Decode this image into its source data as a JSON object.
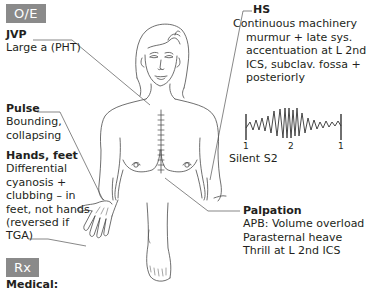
{
  "sections": {
    "oe_badge": "O/E",
    "rx_badge": "Rx"
  },
  "annotations": {
    "jvp": {
      "title": "JVP",
      "lines": [
        "Large a (PHT)"
      ]
    },
    "pulse": {
      "title": "Pulse",
      "lines": [
        "Bounding,",
        "collapsing"
      ]
    },
    "hands_feet": {
      "title": "Hands, feet",
      "lines": [
        "Differential",
        "cyanosis +",
        "clubbing – in",
        "feet, not hands",
        "(reversed if",
        "TGA)"
      ]
    },
    "hs": {
      "title": "HS",
      "lines": [
        "Continuous machinery",
        "murmur + late sys.",
        "accentuation at L 2nd",
        "ICS, subclav. fossa +",
        "posteriorly"
      ]
    },
    "waveform": {
      "labels": [
        "1",
        "2",
        "1"
      ],
      "caption": "Silent S2"
    },
    "palpation": {
      "title": "Palpation",
      "lines": [
        "APB: Volume overload",
        "Parasternal heave",
        "Thrill at L 2nd ICS"
      ]
    }
  },
  "rx": {
    "first_heading": "Medical:"
  },
  "colors": {
    "badge_bg": "#8a8a8a",
    "badge_text": "#ffffff",
    "text": "#231f20",
    "line": "#555555"
  }
}
